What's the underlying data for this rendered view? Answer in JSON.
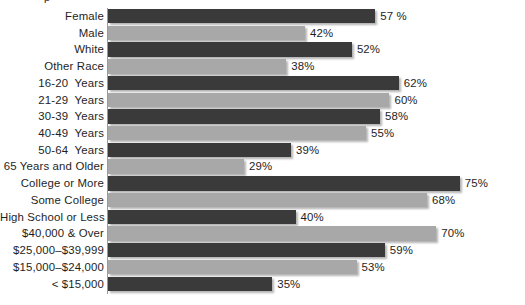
{
  "chart_data": {
    "type": "bar",
    "orientation": "horizontal",
    "title": "",
    "xlabel": "",
    "ylabel": "",
    "xlim": [
      0,
      80
    ],
    "grid": false,
    "legend": null,
    "value_suffix": "%",
    "categories": [
      "Female",
      "Male",
      "White",
      "Other Race",
      "16-20  Years",
      "21-29  Years",
      "30-39  Years",
      "40-49  Years",
      "50-64  Years",
      "65 Years and Older",
      "College or More",
      "Some College",
      "High School or Less",
      "$40,000 & Over",
      "$25,000–$39,999",
      "$15,000–$24,000",
      "< $15,000"
    ],
    "values": [
      57,
      42,
      52,
      38,
      62,
      60,
      58,
      55,
      39,
      29,
      75,
      68,
      40,
      70,
      59,
      53,
      35
    ],
    "value_labels": [
      "57 %",
      "42%",
      "52%",
      "38%",
      "62%",
      "60%",
      "58%",
      "55%",
      "39%",
      "29%",
      "75%",
      "68%",
      "40%",
      "70%",
      "59%",
      "53%",
      "35%"
    ],
    "bar_styles": [
      "dark",
      "light",
      "dark",
      "light",
      "dark",
      "light",
      "dark",
      "light",
      "dark",
      "light",
      "dark",
      "light",
      "dark",
      "light",
      "dark",
      "light",
      "dark"
    ],
    "colors": {
      "dark_bar": "#3a3a3a",
      "light_bar": "#a8a8a8",
      "background": "#ffffff",
      "text": "#1e1e1e"
    }
  },
  "layout": {
    "bar_origin_x": 108,
    "px_per_percent": 4.69,
    "row_height": 16.72,
    "bar_height": 14.4,
    "first_row_top": 9,
    "label_gap": 5
  },
  "artifact": {
    "top_fragment": "p"
  }
}
